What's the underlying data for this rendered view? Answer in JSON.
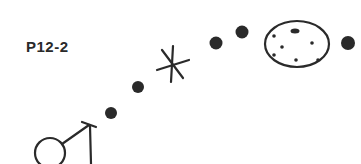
{
  "label": "P12-2",
  "colors": {
    "ink": "#2a2a2a",
    "background": "#ffffff"
  },
  "elements": [
    {
      "type": "male-symbol",
      "x": 62,
      "y": 150
    },
    {
      "type": "dot",
      "x": 111,
      "y": 113
    },
    {
      "type": "dot",
      "x": 138,
      "y": 87
    },
    {
      "type": "asterisk",
      "x": 172,
      "y": 65
    },
    {
      "type": "dot",
      "x": 216,
      "y": 43
    },
    {
      "type": "dot",
      "x": 242,
      "y": 32
    },
    {
      "type": "speckled-ellipse",
      "x": 297,
      "y": 44
    },
    {
      "type": "dot",
      "x": 348,
      "y": 43
    }
  ]
}
